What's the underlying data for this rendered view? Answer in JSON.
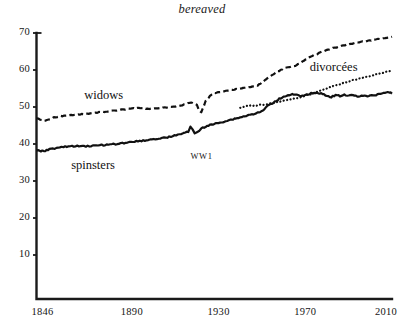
{
  "chart_data": {
    "type": "line",
    "title": "bereaved",
    "xlabel": "",
    "ylabel": "",
    "xlim": [
      1846,
      2010
    ],
    "ylim": [
      0,
      70
    ],
    "grid": false,
    "legend_position": "inline-labels",
    "xticks": [
      "1846",
      "1890",
      "1930",
      "1970",
      "2010"
    ],
    "xtick_values": [
      1846,
      1890,
      1930,
      1970,
      2010
    ],
    "yticks": [
      "10",
      "20",
      "30",
      "40",
      "50",
      "60",
      "70"
    ],
    "ytick_values": [
      10,
      20,
      30,
      40,
      50,
      60,
      70
    ],
    "annotations": [
      {
        "text": "WW1",
        "x": 1917,
        "y": 36.5
      }
    ],
    "series": [
      {
        "name": "widows",
        "style": "dashed",
        "label_x": 1868,
        "label_y": 52.6,
        "x": [
          1846,
          1850,
          1854,
          1858,
          1862,
          1866,
          1870,
          1874,
          1878,
          1882,
          1886,
          1890,
          1894,
          1898,
          1902,
          1906,
          1910,
          1914,
          1916,
          1918,
          1920,
          1921,
          1922,
          1924,
          1926,
          1928,
          1930,
          1932,
          1934,
          1936,
          1938,
          1940,
          1942,
          1944,
          1946,
          1948,
          1950,
          1952,
          1954,
          1956,
          1958,
          1960,
          1962,
          1964,
          1966,
          1968,
          1970,
          1974,
          1978,
          1982,
          1986,
          1990,
          1994,
          1998,
          2002,
          2006,
          2010
        ],
        "y": [
          47.0,
          46.2,
          47.2,
          47.6,
          47.8,
          48.0,
          48.2,
          48.5,
          48.8,
          49.0,
          49.3,
          49.6,
          49.7,
          49.5,
          49.6,
          49.9,
          50.2,
          50.6,
          51.0,
          51.2,
          50.6,
          49.0,
          48.6,
          51.5,
          53.0,
          53.8,
          54.0,
          54.2,
          54.4,
          54.6,
          54.8,
          55.0,
          55.2,
          55.3,
          55.5,
          55.8,
          56.6,
          57.5,
          58.4,
          59.2,
          59.8,
          60.4,
          60.8,
          61.0,
          61.3,
          62.0,
          62.8,
          64.0,
          65.0,
          65.8,
          66.4,
          67.0,
          67.4,
          67.8,
          68.2,
          68.6,
          69.0
        ]
      },
      {
        "name": "spinsters",
        "style": "solid",
        "label_x": 1862,
        "label_y": 33.8,
        "x": [
          1846,
          1848,
          1850,
          1852,
          1856,
          1860,
          1864,
          1868,
          1872,
          1876,
          1880,
          1884,
          1888,
          1892,
          1896,
          1900,
          1904,
          1908,
          1912,
          1914,
          1916,
          1917,
          1918,
          1919,
          1920,
          1921,
          1922,
          1924,
          1926,
          1928,
          1930,
          1932,
          1934,
          1936,
          1938,
          1940,
          1942,
          1944,
          1946,
          1948,
          1950,
          1952,
          1954,
          1956,
          1958,
          1960,
          1962,
          1964,
          1966,
          1968,
          1970,
          1972,
          1974,
          1976,
          1978,
          1980,
          1982,
          1984,
          1986,
          1988,
          1990,
          1992,
          1994,
          1996,
          1998,
          2000,
          2002,
          2004,
          2006,
          2008,
          2010
        ],
        "y": [
          38.3,
          38.0,
          38.2,
          38.6,
          39.0,
          39.3,
          39.4,
          39.4,
          39.5,
          39.7,
          39.9,
          40.1,
          40.4,
          40.7,
          41.0,
          41.3,
          41.6,
          42.0,
          42.6,
          43.0,
          43.3,
          44.6,
          43.8,
          42.9,
          43.1,
          43.6,
          44.2,
          44.7,
          45.1,
          45.4,
          45.7,
          46.0,
          46.3,
          46.6,
          46.9,
          47.2,
          47.5,
          47.8,
          48.1,
          48.4,
          48.8,
          50.0,
          50.8,
          51.5,
          52.2,
          52.8,
          53.2,
          53.4,
          53.2,
          52.9,
          53.1,
          53.6,
          53.9,
          53.8,
          53.5,
          53.0,
          52.7,
          53.2,
          53.0,
          53.4,
          53.0,
          53.2,
          52.9,
          53.1,
          52.9,
          53.0,
          53.2,
          53.5,
          53.8,
          54.1,
          53.6
        ]
      },
      {
        "name": "divorcées",
        "style": "dotted",
        "label_x": 1972,
        "label_y": 60.2,
        "x": [
          1940,
          1942,
          1944,
          1946,
          1950,
          1954,
          1958,
          1962,
          1966,
          1970,
          1974,
          1978,
          1982,
          1986,
          1990,
          1994,
          1998,
          2002,
          2006,
          2010
        ],
        "y": [
          49.8,
          50.1,
          50.3,
          50.4,
          50.6,
          51.0,
          51.4,
          51.9,
          52.4,
          53.0,
          53.8,
          54.6,
          55.4,
          56.2,
          56.9,
          57.5,
          58.1,
          58.7,
          59.3,
          59.9
        ]
      }
    ]
  },
  "colors": {
    "ink": "#111111",
    "axis": "#1a1a1a"
  }
}
